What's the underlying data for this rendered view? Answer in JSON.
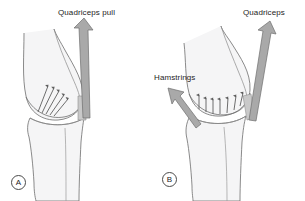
{
  "figure": {
    "background_color": "#ffffff",
    "bone_fill": "#f5f5f6",
    "outline_color": "#6d6d6d",
    "arrow_fill": "#a9a9a9",
    "arrow_outline": "#6f6f6f",
    "small_arrow_color": "#5e5e5e",
    "text_color": "#1d1d1d"
  },
  "panels": [
    {
      "id": "A",
      "badge_label": "A",
      "labels": [
        {
          "name": "quadriceps-pull",
          "text": "Quadriceps pull"
        }
      ],
      "arrows": {
        "major": {
          "name": "quadriceps-pull-arrow",
          "direction": "up",
          "tilt_deg": 3
        },
        "minor_fan_count": 5,
        "minor_fan_direction": "up-right"
      }
    },
    {
      "id": "B",
      "badge_label": "B",
      "labels": [
        {
          "name": "quadriceps",
          "text": "Quadriceps"
        },
        {
          "name": "hamstrings",
          "text": "Hamstrings"
        }
      ],
      "arrows": {
        "major": {
          "name": "quadriceps-arrow",
          "direction": "up",
          "tilt_deg": 7
        },
        "hamstrings": {
          "name": "hamstrings-arrow",
          "direction": "up-left"
        },
        "minor_row_count": 7,
        "minor_row_direction": "up"
      }
    }
  ],
  "labels": {
    "quadriceps_pull": "Quadriceps pull",
    "quadriceps": "Quadriceps",
    "hamstrings": "Hamstrings",
    "panel_a": "A",
    "panel_b": "B"
  }
}
